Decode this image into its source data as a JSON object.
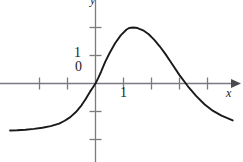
{
  "figure": {
    "width": 243,
    "height": 162,
    "background_color": "#ffffff",
    "curve_color": "#1a1a1a",
    "axis_color": "#7a7a80",
    "text_color": "#1c1c1c"
  },
  "labels": {
    "y_tick_1": "1",
    "y_tick_0": "0",
    "x_tick_1": "1",
    "x_axis_name": "x",
    "y_axis_name": "y"
  },
  "chart_data": {
    "type": "line",
    "title": "",
    "xlabel": "x",
    "ylabel": "y",
    "grid": false,
    "legend": "none",
    "xlim": [
      -3.05,
      4.9
    ],
    "ylim": [
      -2.95,
      2.95
    ],
    "xticks": [
      -2,
      -1,
      0,
      1,
      2,
      3,
      4
    ],
    "xtick_labels": [
      "",
      "",
      "0",
      "1",
      "",
      "",
      ""
    ],
    "yticks": [
      -2,
      -1,
      0,
      1,
      2
    ],
    "ytick_labels": [
      "",
      "",
      "0",
      "1",
      ""
    ],
    "axis_arrows": [
      "x-positive"
    ],
    "annotations": [
      {
        "text": "0",
        "x": -0.5,
        "y": 0.45
      },
      {
        "text": "1",
        "x": -0.6,
        "y": 1.0
      },
      {
        "text": "1",
        "x": 1.0,
        "y": -0.45
      }
    ],
    "series": [
      {
        "name": "curve",
        "x": [
          -3.05,
          -2.8,
          -2.5,
          -2.2,
          -1.9,
          -1.6,
          -1.3,
          -1.1,
          -0.9,
          -0.7,
          -0.5,
          -0.35,
          -0.2,
          -0.1,
          0.0,
          0.1,
          0.2,
          0.35,
          0.5,
          0.7,
          0.9,
          1.1,
          1.2,
          1.35,
          1.5,
          1.7,
          1.9,
          2.1,
          2.3,
          2.5,
          2.7,
          3.0,
          3.3,
          3.6,
          3.9,
          4.2,
          4.5,
          4.9
        ],
        "y": [
          -1.68,
          -1.67,
          -1.65,
          -1.62,
          -1.58,
          -1.52,
          -1.43,
          -1.33,
          -1.2,
          -1.02,
          -0.78,
          -0.55,
          -0.3,
          -0.15,
          0.0,
          0.2,
          0.42,
          0.78,
          1.08,
          1.44,
          1.72,
          1.92,
          1.98,
          2.0,
          1.98,
          1.9,
          1.76,
          1.56,
          1.32,
          1.05,
          0.75,
          0.3,
          -0.1,
          -0.45,
          -0.75,
          -0.98,
          -1.15,
          -1.32
        ],
        "color": "#1a1a1a",
        "linewidth": 1.9
      }
    ]
  }
}
